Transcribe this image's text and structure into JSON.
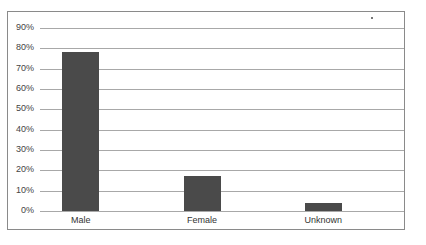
{
  "chart_data": {
    "type": "bar",
    "title": "",
    "xlabel": "",
    "ylabel": "",
    "categories": [
      "Male",
      "Female",
      "Unknown"
    ],
    "values": [
      78,
      17,
      4
    ],
    "value_unit": "%",
    "ylim": [
      0,
      90
    ],
    "yticks": [
      "0%",
      "10%",
      "20%",
      "30%",
      "40%",
      "50%",
      "60%",
      "70%",
      "80%",
      "90%"
    ],
    "grid": true,
    "legend": null,
    "bar_color": "#4a4a4a"
  }
}
